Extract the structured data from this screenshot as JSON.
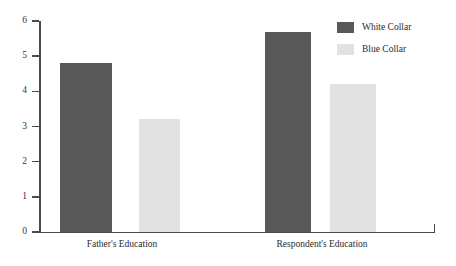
{
  "chart_data": {
    "type": "bar",
    "title": "",
    "xlabel": "",
    "ylabel": "",
    "ylim": [
      0,
      6
    ],
    "yticks": [
      "0",
      "1",
      "2",
      "3",
      "4",
      "5",
      "6"
    ],
    "grid": false,
    "legend_position": "top-right",
    "categories": [
      "Father's Education",
      "Respondent's Education"
    ],
    "series": [
      {
        "name": "White Collar",
        "color": "#595959",
        "values": [
          4.8,
          5.7
        ]
      },
      {
        "name": "Blue Collar",
        "color": "#e2e2e2",
        "values": [
          3.2,
          4.2
        ]
      }
    ]
  },
  "legend": {
    "items": [
      {
        "label": "White Collar",
        "color": "#595959"
      },
      {
        "label": "Blue Collar",
        "color": "#e2e2e2"
      }
    ]
  },
  "axis": {
    "color": "#4a4a4a"
  }
}
